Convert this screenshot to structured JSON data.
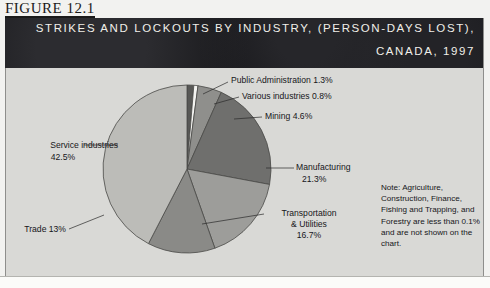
{
  "figure": {
    "number": "FIGURE 12.1",
    "title_line_1": "STRIKES AND LOCKOUTS BY INDUSTRY, (PERSON-DAYS LOST),",
    "title_line_2": "CANADA, 1997"
  },
  "note": "Note: Agriculture, Construction, Finance, Fishing and Trapping, and Forestry are less than 0.1% and are not shown on the chart.",
  "labels": {
    "public_administration": "Public Administration 1.3%",
    "various_industries": "Various industries 0.8%",
    "mining": "Mining 4.6%",
    "manufacturing_name": "Manufacturing",
    "manufacturing_value": "21.3%",
    "transportation_name": "Transportation",
    "transportation_name2": "& Utilities",
    "transportation_value": "16.7%",
    "trade": "Trade 13%",
    "service_name": "Service industries",
    "service_value": "42.5%"
  },
  "colors": {
    "panel_background": "#d9d9d6",
    "title_band": "#17171a",
    "title_text": "#f0efe9",
    "text": "#16161a",
    "slice_stroke": "#4a4a48",
    "public_administration": "#585856",
    "various_industries": "#f4f4f1",
    "mining": "#8f8f8c",
    "manufacturing": "#6f6f6d",
    "transportation": "#9d9d9a",
    "trade": "#8a8a87",
    "service_industries": "#bcbcb8"
  },
  "chart_data": {
    "type": "pie",
    "title": "STRIKES AND LOCKOUTS BY INDUSTRY, (PERSON-DAYS LOST), CANADA, 1997",
    "unit": "percent of person-days lost",
    "start_angle_deg": 0,
    "direction": "clockwise",
    "categories": [
      "Public Administration",
      "Various industries",
      "Mining",
      "Manufacturing",
      "Transportation & Utilities",
      "Trade",
      "Service industries"
    ],
    "values": [
      1.3,
      0.8,
      4.6,
      21.3,
      16.7,
      13.0,
      42.5
    ],
    "slice_colors": [
      "#585856",
      "#f4f4f1",
      "#8f8f8c",
      "#6f6f6d",
      "#9d9d9a",
      "#8a8a87",
      "#bcbcb8"
    ],
    "legend": "labels with leader lines",
    "grid": false,
    "annotation": "Note: Agriculture, Construction, Finance, Fishing and Trapping, and Forestry are less than 0.1% and are not shown on the chart."
  }
}
